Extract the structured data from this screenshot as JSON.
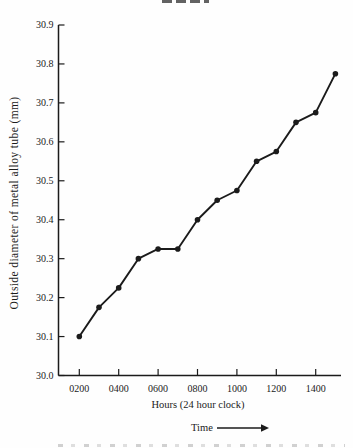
{
  "figure": {
    "background": "#fefefe",
    "ink_color": "#1b1b1b"
  },
  "chart_data": {
    "type": "line",
    "title": "",
    "xlabel": "Hours (24 hour clock)",
    "ylabel": "Outside diameter of metal alloy tube (mm)",
    "time_arrow_label": "Time",
    "x_labels": [
      "0200",
      "0300",
      "0400",
      "0500",
      "0600",
      "0700",
      "0800",
      "0900",
      "1000",
      "1100",
      "1200",
      "1300",
      "1400",
      "1500"
    ],
    "y_values": [
      30.1,
      30.175,
      30.225,
      30.3,
      30.325,
      30.325,
      30.4,
      30.45,
      30.475,
      30.55,
      30.575,
      30.65,
      30.675,
      30.775
    ],
    "x_tick_labels": [
      "0200",
      "0400",
      "0600",
      "0800",
      "1000",
      "1200",
      "1400"
    ],
    "y_tick_labels": [
      "30.0",
      "30.1",
      "30.2",
      "30.3",
      "30.4",
      "30.5",
      "30.6",
      "30.7",
      "30.8",
      "30.9"
    ],
    "ylim": [
      30.0,
      30.9
    ],
    "xlim_hours": [
      95,
      1530
    ],
    "grid": false,
    "legend": "none",
    "marker": "filled-circle",
    "series_color": "#1b1b1b"
  }
}
